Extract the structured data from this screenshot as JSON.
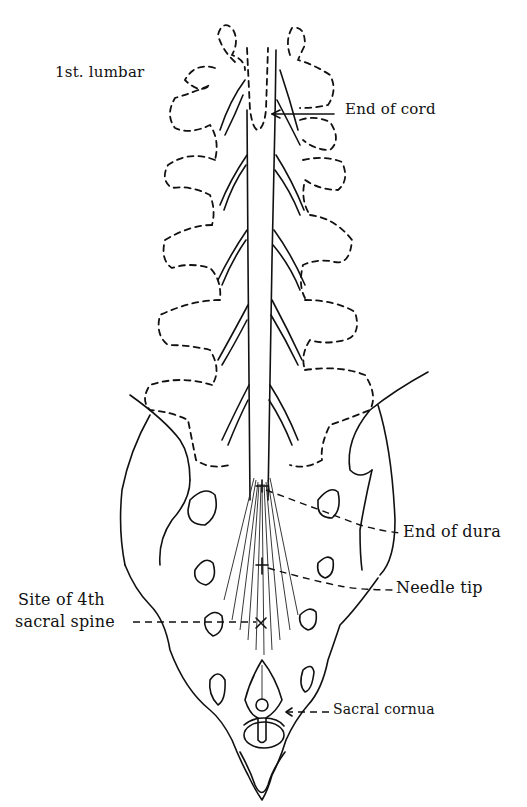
{
  "diagram": {
    "colors": {
      "ink": "#111111",
      "background": "#ffffff"
    },
    "labels": [
      {
        "id": "first-lumbar",
        "text": "1st. lumbar"
      },
      {
        "id": "end-of-cord",
        "text": "End of cord"
      },
      {
        "id": "end-of-dura",
        "text": "End of dura"
      },
      {
        "id": "needle-tip",
        "text": "Needle tip"
      },
      {
        "id": "site-4th-sacral-line1",
        "text": "Site of 4th"
      },
      {
        "id": "site-4th-sacral-line2",
        "text": "sacral spine"
      },
      {
        "id": "sacral-cornua",
        "text": "Sacral cornua"
      }
    ],
    "markers": [
      {
        "id": "end-of-dura-marker",
        "symbol": "+"
      },
      {
        "id": "needle-tip-marker",
        "symbol": "+"
      },
      {
        "id": "fourth-sacral-spine-marker",
        "symbol": "×"
      }
    ]
  }
}
